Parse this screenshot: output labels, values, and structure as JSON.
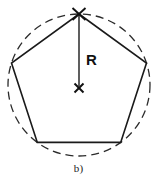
{
  "figure": {
    "caption": "b)",
    "radius_label": "R",
    "background_color": "#ffffff",
    "stroke_color": "#1a1a1a",
    "dash_color": "#2b2b2b",
    "geometry": {
      "center": {
        "x": 79,
        "y": 85
      },
      "circumradius": 71,
      "polygon_sides": 5,
      "circle": {
        "style": "dashed",
        "dash_length": 8,
        "gap_length": 5,
        "stroke_width": 1.3,
        "top": {
          "x": 79,
          "y": 14
        },
        "bottom": {
          "x": 79,
          "y": 156
        },
        "left": {
          "x": 8,
          "y": 85
        },
        "right": {
          "x": 150,
          "y": 85
        }
      },
      "polygon_vertices": [
        {
          "name": "top",
          "x": 79,
          "y": 14
        },
        {
          "name": "right",
          "x": 146.5,
          "y": 63
        },
        {
          "name": "bottom-right",
          "x": 120.7,
          "y": 142.4
        },
        {
          "name": "bottom-left",
          "x": 37.3,
          "y": 142.4
        },
        {
          "name": "left",
          "x": 11.5,
          "y": 63
        }
      ],
      "polygon": {
        "style": "solid",
        "stroke_width": 1.6,
        "fill": "none"
      },
      "radius_line": {
        "from": {
          "x": 79,
          "y": 85
        },
        "to": {
          "x": 79,
          "y": 14
        },
        "stroke_width": 1.4,
        "length_px": 71
      },
      "center_marker": {
        "type": "x-cross",
        "x": 79,
        "y": 88,
        "arm": 5.5,
        "stroke_width": 1.8
      },
      "apex_marker": {
        "type": "x-cross",
        "x": 79,
        "y": 14,
        "arm": 6.5,
        "stroke_width": 1.8
      },
      "radius_label_position": {
        "x": 86,
        "y": 60
      }
    }
  }
}
